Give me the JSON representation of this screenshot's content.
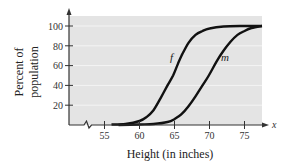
{
  "chart_data": {
    "type": "line",
    "title": "",
    "xlabel": "Height (in inches)",
    "ylabel": "Percent of population",
    "ylabel_lines": [
      "Percent of",
      "population"
    ],
    "x_axis_var": "x",
    "xlim": [
      50,
      78
    ],
    "ylim": [
      0,
      110
    ],
    "x_ticks": [
      55,
      60,
      65,
      70,
      75
    ],
    "y_ticks": [
      20,
      40,
      60,
      80,
      100
    ],
    "grid": "horizontal",
    "axis_break_on_x": true,
    "legend": "inline curve labels",
    "series": [
      {
        "name": "f",
        "label": "f",
        "x": [
          56,
          58,
          60,
          61,
          62,
          63,
          64,
          64.8,
          65.5,
          66,
          67,
          68,
          69,
          70,
          72,
          75,
          77.5
        ],
        "y": [
          0.5,
          1,
          4,
          8,
          15,
          27,
          40,
          50,
          62,
          70,
          83,
          91,
          95,
          97.5,
          99.5,
          100,
          100
        ]
      },
      {
        "name": "m",
        "label": "m",
        "x": [
          57,
          60,
          62,
          64,
          65,
          66,
          67,
          68,
          69,
          69.9,
          71,
          72,
          73,
          74,
          75,
          76,
          77.5
        ],
        "y": [
          0,
          0.5,
          1,
          3,
          6,
          11,
          19,
          29,
          40,
          50,
          64,
          75,
          84,
          91,
          95,
          98,
          100
        ]
      }
    ],
    "annotations": [
      {
        "text": "f",
        "x": 65.5,
        "y": 68
      },
      {
        "text": "m",
        "x": 71.3,
        "y": 68
      }
    ]
  },
  "axes": {
    "x_ticks": [
      "55",
      "60",
      "65",
      "70",
      "75"
    ],
    "y_ticks": [
      "100",
      "80",
      "60",
      "40",
      "20"
    ],
    "xlabel": "Height (in inches)",
    "ylabel_line1": "Percent of",
    "ylabel_line2": "population",
    "x_var": "x"
  },
  "labels": {
    "f": "f",
    "m": "m"
  },
  "colors": {
    "plot_background": "#e4e4e4",
    "gridline": "#f4f4f4",
    "axis": "#333333",
    "curve": "#111111"
  }
}
